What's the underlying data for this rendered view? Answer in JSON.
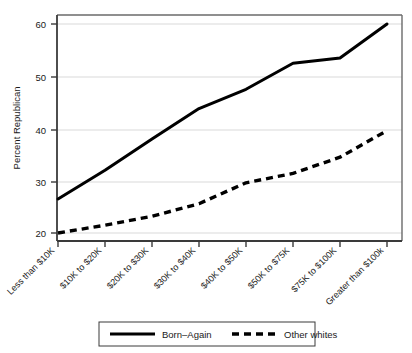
{
  "chart_data": {
    "type": "line",
    "title": "",
    "xlabel": "",
    "ylabel": "Percent Republican",
    "ylim": [
      19,
      61.5
    ],
    "yticks": [
      20,
      30,
      40,
      50,
      60
    ],
    "ytick_labels": [
      "20",
      "30",
      "40",
      "50",
      "60"
    ],
    "grid": true,
    "grid_axis": "y",
    "legend_position": "bottom",
    "categories": [
      "Less than $10K",
      "$10K to $20K",
      "$20K to $30K",
      "$30K to $40K",
      "$40K to $50K",
      "$50K to $75K",
      "$75K to $100K",
      "Greater than $100k"
    ],
    "series": [
      {
        "name": "Born–Again",
        "style": "solid",
        "color": "#000000",
        "values": [
          26.5,
          32.0,
          38.0,
          43.8,
          47.5,
          52.5,
          53.5,
          60.0
        ]
      },
      {
        "name": "Other whites",
        "style": "dashed",
        "color": "#000000",
        "values": [
          20.0,
          21.5,
          23.2,
          25.6,
          29.6,
          31.4,
          34.5,
          39.6
        ]
      }
    ]
  },
  "legend": {
    "entries": [
      {
        "label": "Born–Again",
        "style": "solid"
      },
      {
        "label": "Other whites",
        "style": "dashed"
      }
    ]
  },
  "colors": {
    "line": "#000000",
    "grid": "#ececed",
    "frame": "#5a5a5a",
    "background": "#ffffff"
  }
}
